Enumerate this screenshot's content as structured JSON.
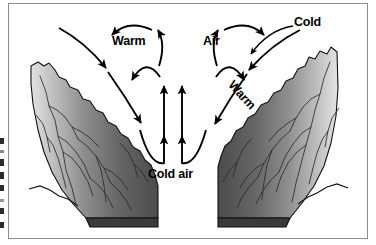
{
  "diagram": {
    "labels": {
      "warm_left": "Warm",
      "air": "Air",
      "cold": "Cold",
      "cold_air": "Cold air",
      "warm_right": "Warm"
    },
    "colors": {
      "frame_border": "#8c8c8c",
      "background": "#ffffff",
      "ink": "#000000",
      "slope_dark": "#4a4a4a",
      "slope_mid": "#6e6e6e",
      "slope_light": "#d8d8d8",
      "slope_base": "#3a3a3a"
    },
    "elements": {
      "left_slope": "left-mountain-slope",
      "right_slope": "right-mountain-slope",
      "left_cell": "left-circulation-cell",
      "right_cell": "right-circulation-cell",
      "updraft_arrows": "central-updraft-arrows",
      "inflow_arrows": "descending-inflow-arrows"
    }
  }
}
